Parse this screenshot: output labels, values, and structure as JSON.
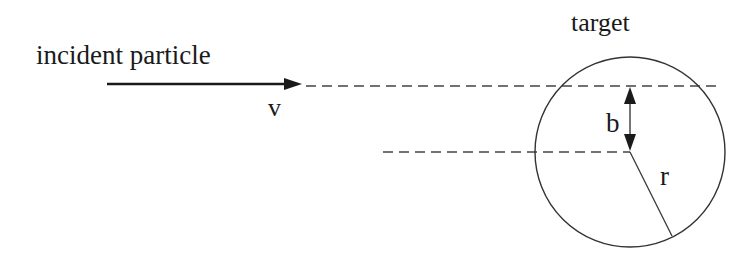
{
  "diagram": {
    "labels": {
      "incident": "incident particle",
      "velocity": "v",
      "target": "target",
      "impact_parameter": "b",
      "radius": "r"
    },
    "colors": {
      "stroke": "#1a1a1a",
      "dashed": "#444444",
      "background": "#ffffff"
    }
  }
}
